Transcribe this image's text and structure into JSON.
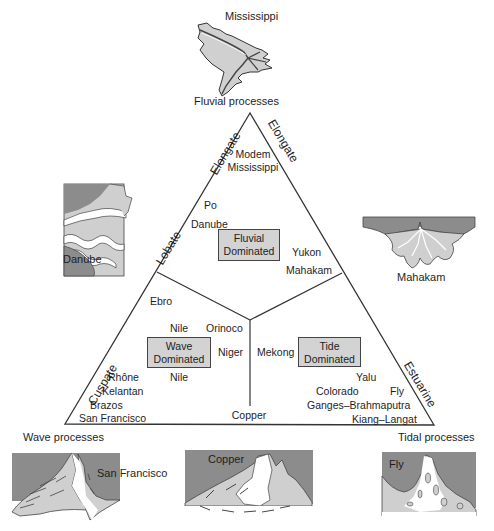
{
  "diagram": {
    "type": "ternary-classification",
    "vertices": {
      "top": "Fluvial processes",
      "bottom_left": "Wave processes",
      "bottom_right": "Tidal processes"
    },
    "side_labels": {
      "left_upper": "Elongate",
      "right_upper": "Elongate",
      "left_middle": "Lobate",
      "left_lower": "Cuspate",
      "right_lower": "Estuarine"
    },
    "regions": {
      "fluvial": {
        "label_line1": "Fluvial",
        "label_line2": "Dominated"
      },
      "wave": {
        "label_line1": "Wave",
        "label_line2": "Dominated"
      },
      "tide": {
        "label_line1": "Tide",
        "label_line2": "Dominated"
      }
    },
    "deltas": {
      "modem": "Modem",
      "mississippi": "Mississippi",
      "po": "Po",
      "danube": "Danube",
      "yukon": "Yukon",
      "mahakam": "Mahakam",
      "ebro": "Ebro",
      "nile_upper": "Nile",
      "orinoco": "Orinoco",
      "niger": "Niger",
      "nile_lower": "Nile",
      "rhone": "Rhône",
      "kelantan": "Kelantan",
      "brazos": "Brazos",
      "san_francisco": "San Francisco",
      "mekong": "Mekong",
      "yalu": "Yalu",
      "colorado": "Colorado",
      "fly": "Fly",
      "ganges": "Ganges–Brahmaputra",
      "kiang": "Kiang–Langat",
      "copper": "Copper"
    },
    "maps": {
      "mississippi": "Mississippi",
      "danube": "Danube",
      "mahakam": "Mahakam",
      "san_francisco": "San Francisco",
      "copper": "Copper",
      "fly": "Fly"
    }
  },
  "colors": {
    "land_dark": "#8c8c8c",
    "land_light": "#cfcfcf",
    "box_fill": "#d3d3d3",
    "line": "#333333"
  }
}
